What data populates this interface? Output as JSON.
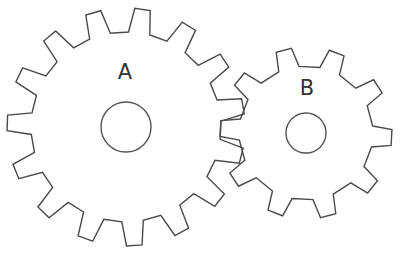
{
  "diagram": {
    "line_color": "#4a4a4a",
    "background": "#ffffff",
    "gears": [
      {
        "label": "A",
        "teeth": 15,
        "center": [
          126,
          127
        ],
        "outer_radius": 119,
        "root_radius": 95,
        "hole_radius": 25,
        "phase_deg": -82,
        "tip_width_deg": 7.5,
        "base_width_deg": 13,
        "label_pos": [
          125,
          72
        ]
      },
      {
        "label": "B",
        "teeth": 10,
        "center": [
          306,
          133
        ],
        "outer_radius": 86,
        "root_radius": 67,
        "hole_radius": 20,
        "phase_deg": 3,
        "tip_width_deg": 10.5,
        "base_width_deg": 18,
        "label_pos": [
          307,
          88
        ]
      }
    ]
  }
}
